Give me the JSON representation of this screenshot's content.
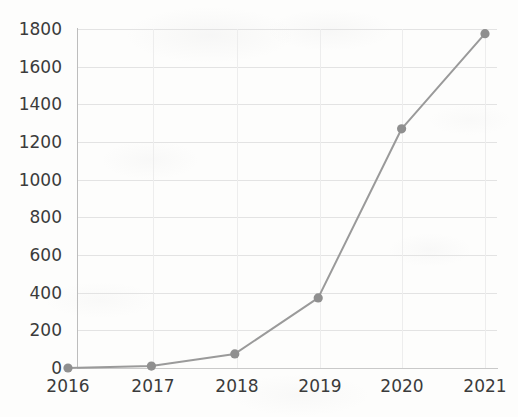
{
  "chart_data": {
    "type": "line",
    "title": "",
    "subtitle": "",
    "xlabel": "",
    "ylabel": "",
    "categories": [
      "2016",
      "2017",
      "2018",
      "2019",
      "2020",
      "2021"
    ],
    "values": [
      0,
      10,
      75,
      372,
      1270,
      1775
    ],
    "series": [
      {
        "name": "",
        "values": [
          0,
          10,
          75,
          372,
          1270,
          1775
        ]
      }
    ],
    "x": [
      2016,
      2017,
      2018,
      2019,
      2020,
      2021
    ],
    "xlim": [
      2016,
      2021
    ],
    "ylim": [
      0,
      1800
    ],
    "ytick_labels": [
      "0",
      "200",
      "400",
      "600",
      "800",
      "1000",
      "1200",
      "1400",
      "1600",
      "1800"
    ],
    "ytick_values": [
      0,
      200,
      400,
      600,
      800,
      1000,
      1200,
      1400,
      1600,
      1800
    ],
    "xtick_labels": [
      "2016",
      "2017",
      "2018",
      "2019",
      "2020",
      "2021"
    ],
    "grid": "horizontal-and-vertical",
    "legend": "none",
    "annotations": [],
    "colors": {
      "line": "#9a9a9a",
      "marker": "#8f8f8f",
      "grid": "#e3e3e3",
      "axis": "#c2c2c2",
      "tick_label": "#3b3b3b",
      "background": "#fdfdfc"
    },
    "marker_style": "circle",
    "line_width": 2
  }
}
